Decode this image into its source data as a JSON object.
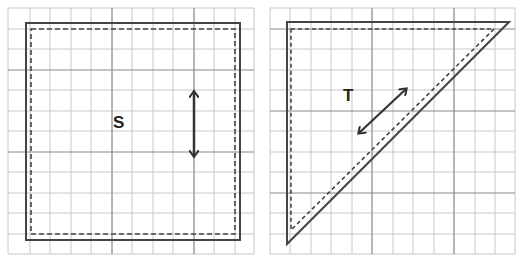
{
  "figure": {
    "panels": [
      {
        "id": "left",
        "shape": "square",
        "label": "S",
        "arrow": "vertical double-headed arrow",
        "outline_solid": "original position",
        "outline_dashed": "shifted position"
      },
      {
        "id": "right",
        "shape": "right triangle",
        "label": "T",
        "arrow": "diagonal double-headed arrow",
        "outline_solid": "original position",
        "outline_dashed": "shifted position"
      }
    ],
    "colors": {
      "grid_light": "#c8c8c8",
      "grid_major": "#888888",
      "shape_line": "#444444",
      "background": "#ffffff"
    }
  }
}
